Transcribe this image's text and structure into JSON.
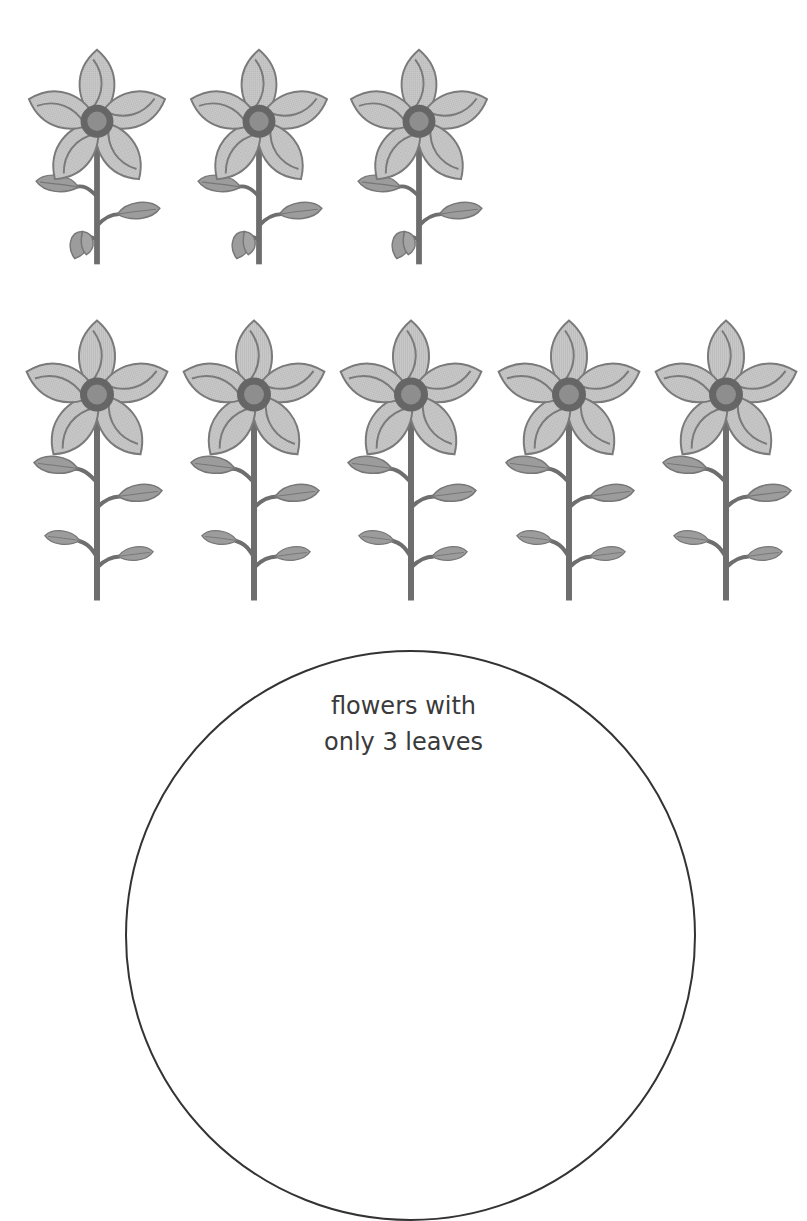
{
  "colors": {
    "petal": "#c4c4c4",
    "petal_stroke": "#7a7a7a",
    "center": "#8c8c8c",
    "center_ring": "#5a5a5a",
    "leaf": "#9a9a9a",
    "stem": "#6e6e6e",
    "circle_stroke": "#333333",
    "text": "#3a3a3a"
  },
  "rows": [
    {
      "name": "top-row",
      "flowers": [
        {
          "leaves": 3,
          "x": 22,
          "y": 42
        },
        {
          "leaves": 3,
          "x": 184,
          "y": 42
        },
        {
          "leaves": 3,
          "x": 344,
          "y": 42
        }
      ]
    },
    {
      "name": "bottom-row",
      "flowers": [
        {
          "leaves": 4,
          "x": 22,
          "y": 310
        },
        {
          "leaves": 4,
          "x": 179,
          "y": 310
        },
        {
          "leaves": 4,
          "x": 336,
          "y": 310
        },
        {
          "leaves": 4,
          "x": 494,
          "y": 310
        },
        {
          "leaves": 4,
          "x": 651,
          "y": 310
        }
      ]
    }
  ],
  "sorting_circle": {
    "label_line1": "flowers with",
    "label_line2": "only 3 leaves"
  }
}
